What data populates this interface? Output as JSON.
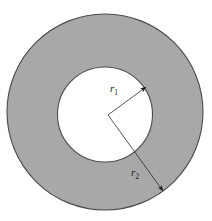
{
  "figure": {
    "name": "annulus-cross-section",
    "background_color": "#ffffff",
    "shaded_region_color": "#a8a8a8",
    "hole_color": "#ffffff",
    "outline_color": "#4a4a4a",
    "leader_line_color": "#2b2b2b"
  },
  "geometry": {
    "outer_circle": {
      "cx": 105,
      "cy": 112,
      "r": 98
    },
    "inner_circle": {
      "cx": 105,
      "cy": 114.5,
      "r": 47.5
    },
    "vertex": {
      "x": 108,
      "y": 115
    },
    "inner_arrow_tip": {
      "x": 146,
      "y": 87
    },
    "outer_arrow_tip": {
      "x": 163,
      "y": 191
    }
  },
  "labels": {
    "inner_radius": {
      "symbol": "r",
      "subscript": "1",
      "x": 110,
      "y": 92
    },
    "outer_radius": {
      "symbol": "r",
      "subscript": "2",
      "x": 131,
      "y": 176
    }
  }
}
